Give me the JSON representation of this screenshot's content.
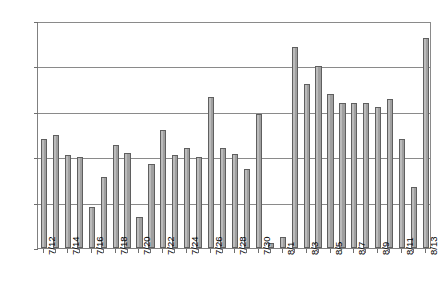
{
  "chart_data": {
    "type": "bar",
    "title": "",
    "subtitle": "",
    "xlabel": "",
    "ylabel": "",
    "ylim": [
      0,
      250
    ],
    "ytick_step": 50,
    "yticks": [
      0,
      50,
      100,
      150,
      200,
      250
    ],
    "ytick_labels": [
      "0",
      "50",
      "100",
      "150",
      "200",
      "250"
    ],
    "grid": true,
    "legend": false,
    "legend_position": "none",
    "bar_color": "#a0a0a0",
    "bar_edge_color": "#5f5f5f",
    "axis_color": "#808080",
    "gridline_color": "#8a8a8a",
    "categories": [
      "7/12",
      "7/13",
      "7/14",
      "7/15",
      "7/16",
      "7/17",
      "7/18",
      "7/19",
      "7/20",
      "7/21",
      "7/22",
      "7/23",
      "7/24",
      "7/25",
      "7/26",
      "7/27",
      "7/28",
      "7/29",
      "7/30",
      "7/31",
      "8/1",
      "8/2",
      "8/3",
      "8/4",
      "8/5",
      "8/6",
      "8/7",
      "8/8",
      "8/9",
      "8/10",
      "8/11",
      "8/12",
      "8/13"
    ],
    "values": [
      120,
      125,
      102,
      100,
      45,
      78,
      113,
      105,
      34,
      93,
      130,
      102,
      110,
      100,
      166,
      110,
      104,
      87,
      148,
      5,
      12,
      221,
      181,
      200,
      170,
      160,
      160,
      160,
      155,
      164,
      120,
      67,
      231
    ],
    "tick_labels_shown": [
      "7/12",
      "7/14",
      "7/16",
      "7/18",
      "7/20",
      "7/22",
      "7/24",
      "7/26",
      "7/28",
      "7/30",
      "8/1",
      "8/3",
      "8/5",
      "8/7",
      "8/9",
      "8/11",
      "8/13"
    ],
    "tick_label_rotation": -90,
    "tick_label_interval": 2
  }
}
